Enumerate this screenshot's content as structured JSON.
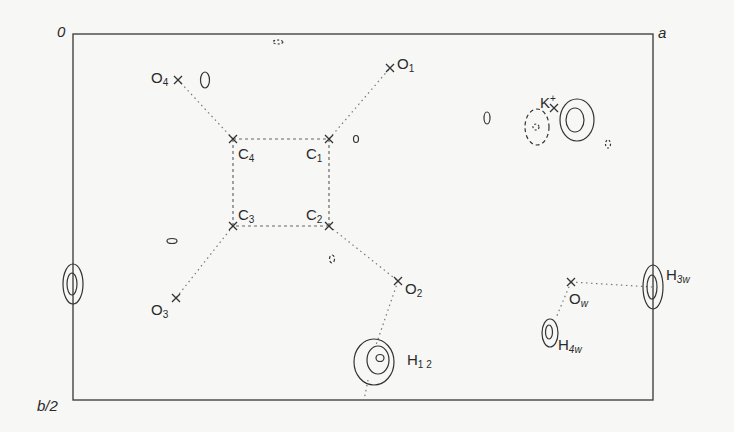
{
  "axes": {
    "origin": "0",
    "a": "a",
    "b_half": "b/2"
  },
  "atoms": [
    {
      "id": "O1",
      "base": "O",
      "sub": "1",
      "x": 330,
      "y": 68
    },
    {
      "id": "O4",
      "base": "O",
      "sub": "4",
      "x": 178,
      "y": 80
    },
    {
      "id": "C4",
      "base": "C",
      "sub": "4",
      "x": 233,
      "y": 139
    },
    {
      "id": "C1",
      "base": "C",
      "sub": "1",
      "x": 329,
      "y": 139
    },
    {
      "id": "C3",
      "base": "C",
      "sub": "3",
      "x": 233,
      "y": 226
    },
    {
      "id": "C2",
      "base": "C",
      "sub": "2",
      "x": 329,
      "y": 226
    },
    {
      "id": "O2",
      "base": "O",
      "sub": "2",
      "x": 398,
      "y": 281
    },
    {
      "id": "O3",
      "base": "O",
      "sub": "3",
      "x": 176,
      "y": 298
    },
    {
      "id": "K",
      "base": "K",
      "sup": "+",
      "x": 553,
      "y": 110
    },
    {
      "id": "Ow",
      "base": "O",
      "sub": "w",
      "x": 571,
      "y": 282
    }
  ],
  "peaks": [
    {
      "id": "H12",
      "base": "H",
      "sub": "1 2"
    },
    {
      "id": "H3w",
      "base": "H",
      "sub": "3w"
    },
    {
      "id": "H4w",
      "base": "H",
      "sub": "4w"
    }
  ],
  "frame": {
    "left": 73,
    "top": 34,
    "right": 653,
    "bottom": 400
  },
  "colors": {
    "line": "#3a3a3a",
    "bond": "#6a6a6a",
    "background": "#f7f7f5"
  }
}
